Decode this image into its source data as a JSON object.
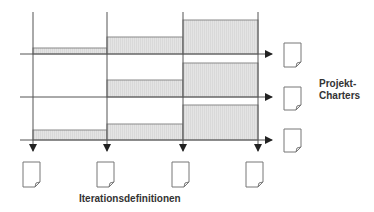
{
  "diagram": {
    "type": "iteration-planning-timeline",
    "colors": {
      "line": "#555555",
      "box_fill": "#e2e2e2",
      "box_stroke": "#888888",
      "doc_stroke": "#777777"
    },
    "labels": {
      "project_charters": [
        "Projekt-",
        "Charters"
      ],
      "iteration_definitions": "Iterationsdefinitionen"
    },
    "iterations": [
      "Iteration 1",
      "Iteration 2",
      "Iteration 3"
    ],
    "projects": [
      "Projekt 1",
      "Projekt 2",
      "Projekt 3"
    ],
    "allocation_boxes": [
      {
        "project": 1,
        "iteration": 1,
        "relative_height": 0.18
      },
      {
        "project": 1,
        "iteration": 2,
        "relative_height": 0.5
      },
      {
        "project": 1,
        "iteration": 3,
        "relative_height": 1.0
      },
      {
        "project": 2,
        "iteration": 1,
        "relative_height": 0.0
      },
      {
        "project": 2,
        "iteration": 2,
        "relative_height": 0.5
      },
      {
        "project": 2,
        "iteration": 3,
        "relative_height": 1.0
      },
      {
        "project": 3,
        "iteration": 1,
        "relative_height": 0.3
      },
      {
        "project": 3,
        "iteration": 2,
        "relative_height": 0.5
      },
      {
        "project": 3,
        "iteration": 3,
        "relative_height": 1.0
      }
    ],
    "document_icons": {
      "project_charters_count": 3,
      "iteration_definitions_count": 4
    }
  }
}
